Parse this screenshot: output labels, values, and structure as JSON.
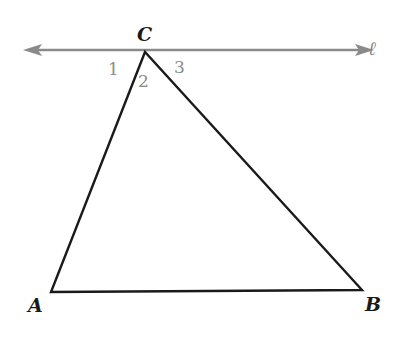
{
  "diagram": {
    "line": {
      "label": "ℓ",
      "color": "#8a8a8a"
    },
    "vertices": {
      "A": "A",
      "B": "B",
      "C": "C"
    },
    "angles": [
      "1",
      "2",
      "3"
    ],
    "colors": {
      "triangle": "#1a1a1a",
      "angle_labels": "#8a8a8a"
    }
  }
}
